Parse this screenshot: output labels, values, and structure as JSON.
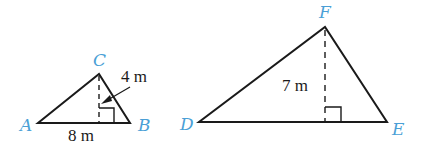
{
  "figures": [
    {
      "name": "triangle-abc",
      "vertices": [
        {
          "label": "A",
          "x": 38,
          "y": 123
        },
        {
          "label": "B",
          "x": 130,
          "y": 123
        },
        {
          "label": "C",
          "x": 99,
          "y": 74
        }
      ],
      "base_label": "8 m",
      "height_label": "4 m",
      "height_foot": {
        "x": 99,
        "y": 123
      }
    },
    {
      "name": "triangle-def",
      "vertices": [
        {
          "label": "D",
          "x": 199,
          "y": 122
        },
        {
          "label": "E",
          "x": 387,
          "y": 122
        },
        {
          "label": "F",
          "x": 325,
          "y": 27
        }
      ],
      "height_label": "7 m",
      "height_foot": {
        "x": 325,
        "y": 122
      }
    }
  ],
  "colors": {
    "vertex_label": "#4a9fd6",
    "line": "#1a1a1a"
  }
}
